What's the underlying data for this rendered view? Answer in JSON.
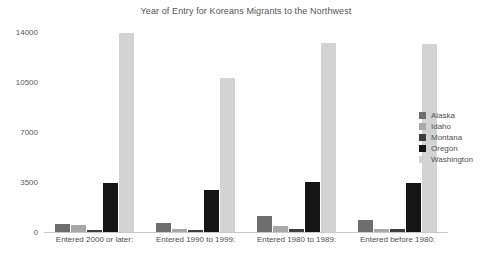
{
  "chart_data": {
    "type": "bar",
    "title": "Year of Entry for Koreans Migrants to the Northwest",
    "xlabel": "",
    "ylabel": "",
    "ylim": [
      0,
      14000
    ],
    "yticks": [
      0,
      3500,
      7000,
      10500,
      14000
    ],
    "ytick_labels": [
      "0",
      "3500",
      "7000",
      "10500",
      "14000"
    ],
    "grid": false,
    "legend_position": "right",
    "categories": [
      "Entered 2000 or later:",
      "Entered 1990 to 1999:",
      "Entered 1980 to 1989:",
      "Entered before 1980:"
    ],
    "series": [
      {
        "name": "Alaska",
        "color": "#6e6e6e",
        "values": [
          530,
          620,
          1130,
          830
        ]
      },
      {
        "name": "Idaho",
        "color": "#a8a8a8",
        "values": [
          470,
          230,
          420,
          200
        ]
      },
      {
        "name": "Montana",
        "color": "#3d3d3d",
        "values": [
          170,
          130,
          180,
          220
        ]
      },
      {
        "name": "Oregon",
        "color": "#151515",
        "values": [
          3400,
          2920,
          3480,
          3450
        ]
      },
      {
        "name": "Washington",
        "color": "#d3d3d3",
        "values": [
          13900,
          10750,
          13200,
          13150
        ]
      }
    ]
  }
}
